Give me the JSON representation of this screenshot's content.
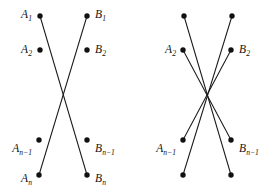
{
  "figure": {
    "background_color": "#ffffff",
    "stroke_color": "#1a1a1a",
    "vertex_color": "#111111",
    "width": 273,
    "height": 195
  },
  "labels": {
    "a1": "A",
    "a1_sub": "1",
    "a2": "A",
    "a2_sub": "2",
    "an1": "A",
    "an1_sub": "n−1",
    "an": "A",
    "an_sub": "n",
    "b1": "B",
    "b1_sub": "1",
    "b2": "B",
    "b2_sub": "2",
    "bn1": "B",
    "bn1_sub": "n−1",
    "bn": "B",
    "bn_sub": "n"
  },
  "diagram_left": {
    "name": "single-crossing-diagram",
    "vertices": [
      {
        "id": "A1",
        "x": 40,
        "y": 16,
        "label": "A_1",
        "label_side": "left"
      },
      {
        "id": "A2",
        "x": 40,
        "y": 50,
        "label": "A_2",
        "label_side": "left"
      },
      {
        "id": "An-1",
        "x": 39,
        "y": 140,
        "label": "A_n-1",
        "label_side": "left"
      },
      {
        "id": "An",
        "x": 39,
        "y": 175,
        "label": "A_n",
        "label_side": "left"
      },
      {
        "id": "B1",
        "x": 87,
        "y": 16,
        "label": "B_1",
        "label_side": "right"
      },
      {
        "id": "B2",
        "x": 87,
        "y": 50,
        "label": "B_2",
        "label_side": "right"
      },
      {
        "id": "Bn-1",
        "x": 87,
        "y": 140,
        "label": "B_n-1",
        "label_side": "right"
      },
      {
        "id": "Bn",
        "x": 87,
        "y": 175,
        "label": "B_n",
        "label_side": "right"
      }
    ],
    "edges": [
      {
        "from": "A1",
        "to": "Bn"
      },
      {
        "from": "An",
        "to": "B1"
      }
    ]
  },
  "diagram_right": {
    "name": "multi-crossing-diagram",
    "vertices": [
      {
        "id": "A1",
        "x": 184,
        "y": 16,
        "label": "",
        "label_side": "none"
      },
      {
        "id": "A2",
        "x": 183,
        "y": 50,
        "label": "A_2",
        "label_side": "left"
      },
      {
        "id": "An-1",
        "x": 183,
        "y": 140,
        "label": "A_n-1",
        "label_side": "left"
      },
      {
        "id": "An",
        "x": 183,
        "y": 175,
        "label": "",
        "label_side": "none"
      },
      {
        "id": "B1",
        "x": 232,
        "y": 16,
        "label": "",
        "label_side": "none"
      },
      {
        "id": "B2",
        "x": 231,
        "y": 50,
        "label": "B_2",
        "label_side": "right"
      },
      {
        "id": "Bn-1",
        "x": 231,
        "y": 140,
        "label": "B_n-1",
        "label_side": "right"
      },
      {
        "id": "Bn",
        "x": 231,
        "y": 175,
        "label": "",
        "label_side": "none"
      }
    ],
    "edges": [
      {
        "from": "A1",
        "to": "Bn"
      },
      {
        "from": "A2",
        "to": "Bn-1"
      },
      {
        "from": "An-1",
        "to": "B2"
      },
      {
        "from": "An",
        "to": "B1"
      }
    ]
  }
}
